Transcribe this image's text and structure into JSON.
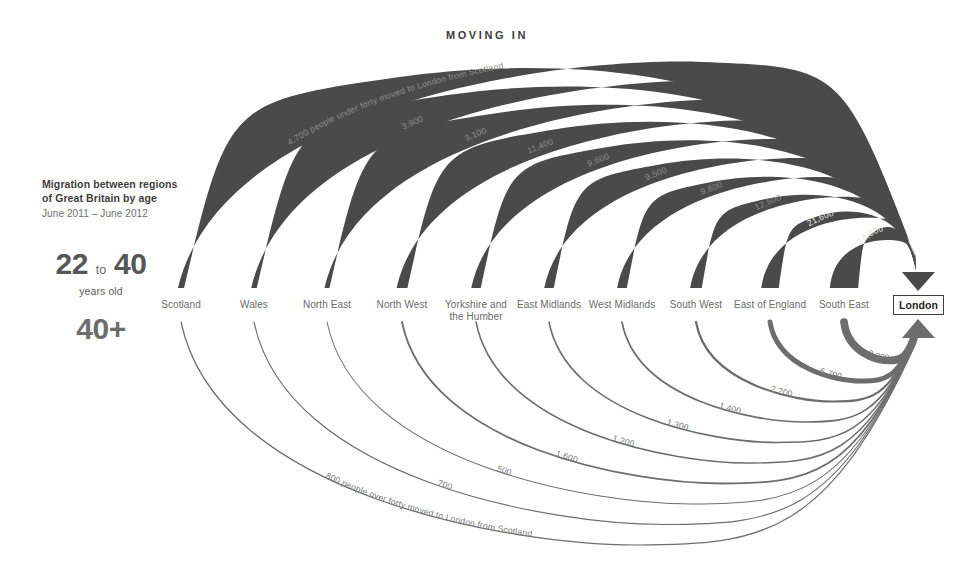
{
  "header": {
    "moving_in": "MOVING IN"
  },
  "legend": {
    "line1": "Migration between regions",
    "line2": "of Great Britain by age",
    "line3": "June 2011 – June 2012",
    "young_num_1": "22",
    "young_to": "to",
    "young_num_2": "40",
    "young_sub": "years old",
    "old_label": "40+"
  },
  "destination": {
    "label": "London"
  },
  "regions": [
    "Scotland",
    "Wales",
    "North East",
    "North West",
    "Yorkshire and the Humber",
    "East Midlands",
    "West Midlands",
    "South West",
    "East of England",
    "South East"
  ],
  "region_label_lines": [
    [
      "Scotland"
    ],
    [
      "Wales"
    ],
    [
      "North East"
    ],
    [
      "North West"
    ],
    [
      "Yorkshire and",
      "the Humber"
    ],
    [
      "East Midlands"
    ],
    [
      "West Midlands"
    ],
    [
      "South West"
    ],
    [
      "East of England"
    ],
    [
      "South East"
    ]
  ],
  "colors": {
    "band_young": "#4a4a4a",
    "band_old": "#6d6d6d",
    "text": "#6b6b6b",
    "accent": "#3d3d3d",
    "background": "#ffffff"
  },
  "annotations": {
    "young_note": "4,700 people under forty moved to London from Scotland",
    "old_note": "800 people over forty moved to London from Scotland"
  },
  "chart_data": {
    "type": "arc-flow",
    "title": "Migration between regions of Great Britain by age",
    "subtitle": "June 2011 – June 2012",
    "direction_title": "MOVING IN",
    "destination": "London",
    "xlabel": "",
    "ylabel": "",
    "categories": [
      "Scotland",
      "Wales",
      "North East",
      "North West",
      "Yorkshire and the Humber",
      "East Midlands",
      "West Midlands",
      "South West",
      "East of England",
      "South East"
    ],
    "series": [
      {
        "name": "22 to 40 years old",
        "color": "#4a4a4a",
        "values": [
          4700,
          3900,
          3100,
          11400,
          9600,
          9500,
          9800,
          12600,
          21600,
          38900
        ],
        "labels": [
          "4,700",
          "3,900",
          "3,100",
          "11,400",
          "9,600",
          "9,500",
          "9,800",
          "12,600",
          "21,600",
          "38,900"
        ]
      },
      {
        "name": "40+",
        "color": "#6d6d6d",
        "values": [
          800,
          700,
          500,
          1600,
          1200,
          1300,
          1400,
          2200,
          5700,
          9300
        ],
        "labels": [
          "800",
          "700",
          "500",
          "1,600",
          "1,200",
          "1,300",
          "1,400",
          "2,200",
          "5,700",
          "9,300"
        ]
      }
    ],
    "annotations": [
      "4,700 people under forty moved to London from Scotland",
      "800 people over forty moved to London from Scotland"
    ],
    "grid": false,
    "legend": "left"
  }
}
